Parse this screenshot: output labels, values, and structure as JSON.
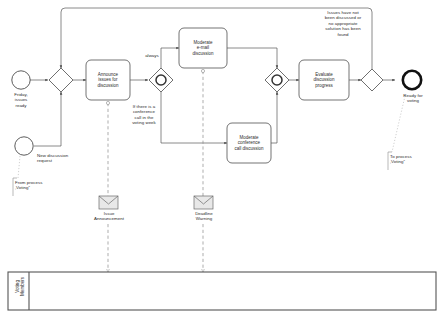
{
  "diagram": {
    "type": "bpmn-process",
    "colors": {
      "stroke": "#4a4a4a",
      "task_stroke": "#5a5a5a",
      "text": "#2b2b2b",
      "end_event": "#000000",
      "lane_stroke": "#555555",
      "message_fill": "#e8e8e8",
      "annotation_dash": "#9a9a9a"
    },
    "events": [
      {
        "id": "start-friday",
        "kind": "start-event",
        "label": "Friday,\nissues\nready"
      },
      {
        "id": "start-new-discussion",
        "kind": "start-event",
        "label": "New discussion\nrequest"
      },
      {
        "id": "end-ready-voting",
        "kind": "end-event",
        "label": "Ready for\nvoting"
      }
    ],
    "gateways": [
      {
        "id": "gw-merge",
        "kind": "exclusive-gateway"
      },
      {
        "id": "gw-split-parallel",
        "kind": "event-based-gateway"
      },
      {
        "id": "gw-join-parallel",
        "kind": "event-based-gateway"
      },
      {
        "id": "gw-decision",
        "kind": "exclusive-gateway"
      }
    ],
    "tasks": [
      {
        "id": "task-announce",
        "label": "Announce\nissues for\ndiscussion"
      },
      {
        "id": "task-moderate-email",
        "label": "Moderate\ne-mail\ndiscussion"
      },
      {
        "id": "task-moderate-call",
        "label": "Moderate\nconference\ncall discussion"
      },
      {
        "id": "task-evaluate",
        "label": "Evaluate\ndiscussion\nprogress"
      }
    ],
    "flow_labels": [
      {
        "id": "flow-always",
        "text": "always"
      },
      {
        "id": "flow-conference-condition",
        "text": "If there is a\nconference\ncall in the\nvoting week"
      },
      {
        "id": "flow-loopback-condition",
        "text": "Issues have not\nbeen discussed or\nno appropriate\nsolution has been\nfound"
      }
    ],
    "messages": [
      {
        "id": "msg-issue-announcement",
        "label": "Issue\nAnnouncement"
      },
      {
        "id": "msg-deadline-warning",
        "label": "Deadline\nWarning"
      }
    ],
    "annotations": [
      {
        "id": "annotation-from-voting",
        "text": "From process\n‚Voting“"
      },
      {
        "id": "annotation-to-voting",
        "text": "To process\n‚Voting“"
      }
    ],
    "lanes": [
      {
        "id": "lane-voting-members",
        "label": "Voting\nMembers"
      }
    ]
  }
}
